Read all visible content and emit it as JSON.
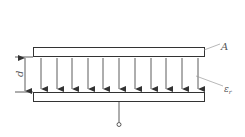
{
  "diagram": {
    "labels": {
      "area": "A",
      "permittivity_base": "ε",
      "permittivity_sub": "r",
      "distance": "d"
    },
    "colors": {
      "stroke": "#333333",
      "label": "#555555",
      "background": "#ffffff"
    },
    "field_lines_count": 11
  }
}
